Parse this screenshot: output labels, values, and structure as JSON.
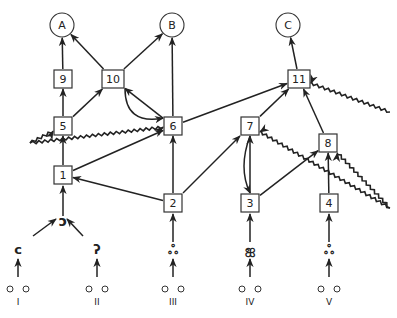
{
  "diagram": {
    "outputs": [
      {
        "id": "A",
        "label": "A",
        "x": 62,
        "y": 25
      },
      {
        "id": "B",
        "label": "B",
        "x": 172,
        "y": 25
      },
      {
        "id": "C",
        "label": "C",
        "x": 288,
        "y": 25
      }
    ],
    "nodes": [
      {
        "id": "1",
        "label": "1",
        "x": 63,
        "y": 175
      },
      {
        "id": "2",
        "label": "2",
        "x": 173,
        "y": 203
      },
      {
        "id": "3",
        "label": "3",
        "x": 250,
        "y": 203
      },
      {
        "id": "4",
        "label": "4",
        "x": 329,
        "y": 203
      },
      {
        "id": "5",
        "label": "5",
        "x": 63,
        "y": 126
      },
      {
        "id": "6",
        "label": "6",
        "x": 173,
        "y": 126
      },
      {
        "id": "7",
        "label": "7",
        "x": 250,
        "y": 126
      },
      {
        "id": "8",
        "label": "8",
        "x": 328,
        "y": 143
      },
      {
        "id": "9",
        "label": "9",
        "x": 63,
        "y": 79
      },
      {
        "id": "10",
        "label": "10",
        "x": 113,
        "y": 79
      },
      {
        "id": "11",
        "label": "11",
        "x": 299,
        "y": 79
      }
    ],
    "inputs": [
      {
        "id": "I",
        "label": "I",
        "glyph": "ᴄ",
        "x": 18
      },
      {
        "id": "II",
        "label": "II",
        "glyph": "ʔ",
        "x": 97
      },
      {
        "id": "III",
        "label": "III",
        "glyph": "ஃ",
        "x": 173
      },
      {
        "id": "IV",
        "label": "IV",
        "glyph": "ஐ",
        "x": 250
      },
      {
        "id": "V",
        "label": "V",
        "glyph": "ஃ",
        "x": 329
      }
    ],
    "merge_glyph": {
      "glyph": "ↄ",
      "x": 63,
      "y": 222
    },
    "edges_straight": [
      [
        "1",
        "5"
      ],
      [
        "5",
        "9"
      ],
      [
        "9",
        "A"
      ],
      [
        "5",
        "10"
      ],
      [
        "10",
        "A"
      ],
      [
        "10",
        "B"
      ],
      [
        "6",
        "10"
      ],
      [
        "6",
        "B"
      ],
      [
        "1",
        "6"
      ],
      [
        "2",
        "1"
      ],
      [
        "2",
        "6"
      ],
      [
        "2",
        "7"
      ],
      [
        "3",
        "7"
      ],
      [
        "3",
        "8"
      ],
      [
        "7",
        "11"
      ],
      [
        "6",
        "11"
      ],
      [
        "8",
        "11"
      ],
      [
        "11",
        "C"
      ],
      [
        "4",
        "8"
      ]
    ],
    "edges_curved": [
      [
        "10",
        "6"
      ],
      [
        "7",
        "3"
      ]
    ],
    "edges_inhibitory_wavy": [
      {
        "from_point": [
          30,
          143
        ],
        "to": "6"
      },
      {
        "from_point": [
          30,
          143
        ],
        "to": "5"
      },
      {
        "from_point": [
          390,
          208
        ],
        "to": "7"
      },
      {
        "from_point": [
          390,
          208
        ],
        "to": "8"
      },
      {
        "from_point": [
          390,
          112
        ],
        "to": "11"
      }
    ]
  }
}
